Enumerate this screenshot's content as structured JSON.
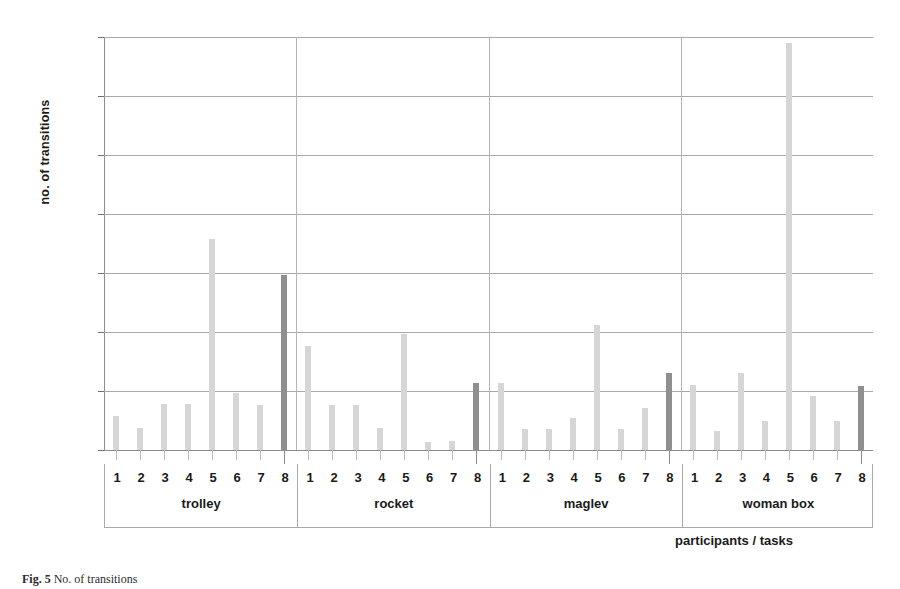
{
  "figure": {
    "caption_prefix": "Fig. 5",
    "caption_text": "No. of transitions"
  },
  "axis": {
    "y_title": "no. of transitions",
    "x_title": "participants / tasks",
    "y_ticks": [
      0,
      5,
      10,
      15,
      20,
      25,
      30,
      35
    ]
  },
  "colors": {
    "bar_light": "#d6d6d6",
    "bar_dark": "#8f8f8f",
    "gridline": "#a8a8a8",
    "axis": "#8d8d8d",
    "text": "#1a1a1a"
  },
  "chart_data": {
    "type": "bar",
    "title": "",
    "xlabel": "participants / tasks",
    "ylabel": "no. of transitions",
    "ylim": [
      0,
      35
    ],
    "yticks": [
      0,
      5,
      10,
      15,
      20,
      25,
      30,
      35
    ],
    "grid": true,
    "legend": "none",
    "categories": [
      "1",
      "2",
      "3",
      "4",
      "5",
      "6",
      "7",
      "8"
    ],
    "groups": [
      {
        "name": "trolley",
        "values": [
          2.9,
          1.9,
          3.9,
          3.9,
          17.9,
          4.8,
          3.8,
          14.8
        ],
        "highlight_index": 7
      },
      {
        "name": "rocket",
        "values": [
          8.8,
          3.8,
          3.8,
          1.9,
          9.8,
          0.7,
          0.8,
          5.7
        ],
        "highlight_index": 7
      },
      {
        "name": "maglev",
        "values": [
          5.7,
          1.8,
          1.8,
          2.7,
          10.6,
          1.8,
          3.6,
          6.5
        ],
        "highlight_index": 7
      },
      {
        "name": "woman box",
        "values": [
          5.5,
          1.6,
          6.5,
          2.5,
          34.5,
          4.6,
          2.5,
          5.4
        ],
        "highlight_index": 7
      }
    ]
  }
}
